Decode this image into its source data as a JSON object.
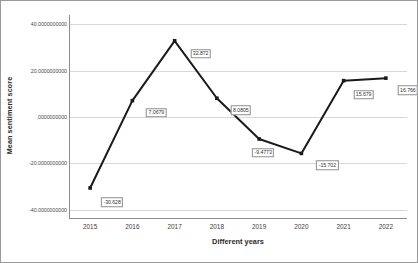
{
  "chart_data": {
    "type": "line",
    "title": "",
    "xlabel": "Different years",
    "ylabel": "Mean sentiment score",
    "categories": [
      "2015",
      "2016",
      "2017",
      "2018",
      "2019",
      "2020",
      "2021",
      "2022"
    ],
    "values": [
      -30.628,
      7.0679,
      32.872,
      8.0805,
      -9.4773,
      -15.702,
      15.679,
      16.766
    ],
    "point_labels": [
      "-30.628",
      "7.0679",
      "32.872",
      "8.0805",
      "-9.4773",
      "-15.702",
      "15.679",
      "16.766"
    ],
    "ylim": [
      -44,
      44
    ],
    "y_ticks": [
      40,
      20,
      0,
      -20,
      -40
    ],
    "y_tick_labels": [
      "40.0000000000",
      "20.0000000000",
      ".0000000000",
      "-20.0000000000",
      "-40.0000000000"
    ],
    "grid": "horizontal",
    "legend": "none",
    "line_color": "#1a1a1a",
    "marker_color": "#1a1a1a",
    "gridline_color": "#d8d8d8",
    "background_color": "#ffffff"
  }
}
